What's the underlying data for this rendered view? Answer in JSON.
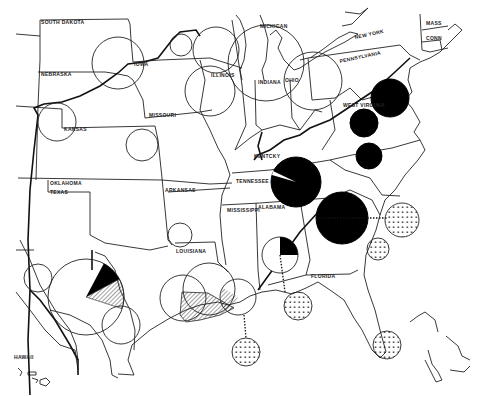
{
  "map": {
    "width": 492,
    "height": 396,
    "colors": {
      "ink": "#000000",
      "paper": "#ffffff"
    },
    "state_labels": [
      {
        "name": "SOUTH DAKOTA",
        "x": 41,
        "y": 24
      },
      {
        "name": "NEBRASKA",
        "x": 41,
        "y": 76
      },
      {
        "name": "IOWA",
        "x": 134,
        "y": 66
      },
      {
        "name": "ILLINOIS",
        "x": 211,
        "y": 77
      },
      {
        "name": "MISSOURI",
        "x": 149,
        "y": 117
      },
      {
        "name": "KANSAS",
        "x": 64,
        "y": 131
      },
      {
        "name": "OKLAHOMA",
        "x": 50,
        "y": 185
      },
      {
        "name": "TEXAS",
        "x": 50,
        "y": 194
      },
      {
        "name": "ARKANSAS",
        "x": 165,
        "y": 192
      },
      {
        "name": "LOUISIANA",
        "x": 176,
        "y": 253
      },
      {
        "name": "MISSISSIPPI",
        "x": 227,
        "y": 212
      },
      {
        "name": "ALABAMA",
        "x": 258,
        "y": 209
      },
      {
        "name": "TENNESSEE",
        "x": 236,
        "y": 183
      },
      {
        "name": "KENTCKY",
        "x": 254,
        "y": 158
      },
      {
        "name": "FLORIDA",
        "x": 311,
        "y": 278
      },
      {
        "name": "MICHIGAN",
        "x": 260,
        "y": 28
      },
      {
        "name": "INDIANA",
        "x": 258,
        "y": 84
      },
      {
        "name": "OHIO",
        "x": 285,
        "y": 82
      },
      {
        "name": "NEW YORK",
        "x": 355,
        "y": 39
      },
      {
        "name": "PENNSYLVANIA",
        "x": 340,
        "y": 63
      },
      {
        "name": "WEST VIRGINIA",
        "x": 343,
        "y": 107
      },
      {
        "name": "MASS",
        "x": 426,
        "y": 25
      },
      {
        "name": "CONN",
        "x": 426,
        "y": 40
      },
      {
        "name": "HAWAII",
        "x": 14,
        "y": 359
      }
    ],
    "circles": [
      {
        "id": "iowa-nebraska",
        "cx": 118,
        "cy": 63,
        "r": 26,
        "style": "outline"
      },
      {
        "id": "chicago-west",
        "cx": 181,
        "cy": 45,
        "r": 11,
        "style": "outline"
      },
      {
        "id": "chicago",
        "cx": 216,
        "cy": 50,
        "r": 23,
        "style": "outline"
      },
      {
        "id": "illinois-central",
        "cx": 210,
        "cy": 91,
        "r": 25,
        "style": "outline"
      },
      {
        "id": "kansas-west",
        "cx": 57,
        "cy": 122,
        "r": 19,
        "style": "outline"
      },
      {
        "id": "kansas-east",
        "cx": 142,
        "cy": 145,
        "r": 16,
        "style": "outline"
      },
      {
        "id": "michigan-indiana",
        "cx": 266,
        "cy": 63,
        "r": 38,
        "style": "outline"
      },
      {
        "id": "ohio",
        "cx": 313,
        "cy": 81,
        "r": 29,
        "style": "outline"
      },
      {
        "id": "maryland",
        "cx": 390,
        "cy": 98,
        "r": 19,
        "style": "solid"
      },
      {
        "id": "west-virginia",
        "cx": 364,
        "cy": 123,
        "r": 14,
        "style": "solid"
      },
      {
        "id": "virginia-south",
        "cx": 369,
        "cy": 156,
        "r": 13,
        "style": "solid"
      },
      {
        "id": "tennessee",
        "cx": 296,
        "cy": 182,
        "r": 25,
        "style": "pie-solid",
        "wedge_start_deg": 200,
        "wedge_end_deg": 215
      },
      {
        "id": "georgia",
        "cx": 342,
        "cy": 218,
        "r": 26,
        "style": "solid"
      },
      {
        "id": "arkansas-south",
        "cx": 180,
        "cy": 235,
        "r": 12,
        "style": "outline"
      },
      {
        "id": "alabama",
        "cx": 280,
        "cy": 255,
        "r": 18,
        "style": "pie-partial",
        "solid_start_deg": -90,
        "solid_end_deg": 0
      },
      {
        "id": "texas-panhandle",
        "cx": 38,
        "cy": 278,
        "r": 14,
        "style": "outline"
      },
      {
        "id": "texas-central",
        "cx": 86,
        "cy": 297,
        "r": 38,
        "style": "pie-mixed",
        "solid_start_deg": -62,
        "solid_end_deg": -28,
        "hatch_start_deg": -28,
        "hatch_end_deg": 18
      },
      {
        "id": "texas-coast",
        "cx": 121,
        "cy": 325,
        "r": 19,
        "style": "outline"
      },
      {
        "id": "louisiana-west",
        "cx": 183,
        "cy": 298,
        "r": 23,
        "style": "outline"
      },
      {
        "id": "louisiana-central",
        "cx": 209,
        "cy": 289,
        "r": 26,
        "style": "outline"
      },
      {
        "id": "new-orleans",
        "cx": 238,
        "cy": 297,
        "r": 18,
        "style": "hatch-partial"
      },
      {
        "id": "gulf-offshore-1",
        "cx": 246,
        "cy": 352,
        "r": 14,
        "style": "dotted"
      },
      {
        "id": "gulf-offshore-2",
        "cx": 298,
        "cy": 306,
        "r": 14,
        "style": "dotted"
      },
      {
        "id": "atlantic-ga",
        "cx": 402,
        "cy": 220,
        "r": 17,
        "style": "dotted"
      },
      {
        "id": "atlantic-fl",
        "cx": 378,
        "cy": 249,
        "r": 11,
        "style": "dotted"
      },
      {
        "id": "south-florida",
        "cx": 387,
        "cy": 345,
        "r": 14,
        "style": "dotted"
      }
    ]
  }
}
